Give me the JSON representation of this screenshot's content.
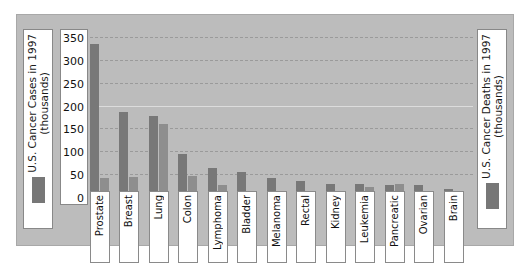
{
  "chart_data": {
    "type": "bar",
    "title": "",
    "xlabel": "",
    "ylabel": "U.S. Cancer Cases in 1997 (thousands)",
    "ylabel_right": "U.S. Cancer Deaths in 1997 (thousands)",
    "ylim": [
      0,
      350
    ],
    "yticks": [
      350,
      300,
      250,
      200,
      150,
      100,
      50,
      0
    ],
    "grid": true,
    "legend_position": "outside-left-and-right",
    "categories": [
      "Prostate",
      "Breast",
      "Lung",
      "Colon",
      "Lymphoma",
      "Bladder",
      "Melanoma",
      "Rectal",
      "Kidney",
      "Leukemia",
      "Pancreatic",
      "Ovarian",
      "Brain"
    ],
    "series": [
      {
        "name": "U.S. Cancer Cases in 1997 (thousands)",
        "color": "#787878",
        "values": [
          334,
          185,
          178,
          95,
          63,
          55,
          42,
          36,
          29,
          29,
          27,
          27,
          18
        ]
      },
      {
        "name": "U.S. Cancer Deaths in 1997 (thousands)",
        "color": "#8e8e8e",
        "values": [
          41,
          44,
          160,
          47,
          26,
          12,
          7,
          9,
          11,
          21,
          28,
          14,
          13
        ]
      }
    ]
  },
  "legend": {
    "left": {
      "line1": "U.S. Cancer Cases in 1997",
      "line2": "(thousands)",
      "text": "U.S. Cancer Cases in 1997\n(thousands)",
      "swatch_color": "#777777"
    },
    "right": {
      "line1": "U.S. Cancer Deaths in 1997",
      "line2": "(thousands)",
      "text": "U.S. Cancer Deaths in 1997\n(thousands)",
      "swatch_color": "#777777"
    }
  },
  "colors": {
    "figure_background": "#bcbcbc",
    "plot_background": "#bcbcbc",
    "bar_cases": "#787878",
    "bar_deaths": "#8e8e8e",
    "gridline": "#9a9a9a",
    "label_box": "#ffffff",
    "page_background": "#ffffff"
  }
}
